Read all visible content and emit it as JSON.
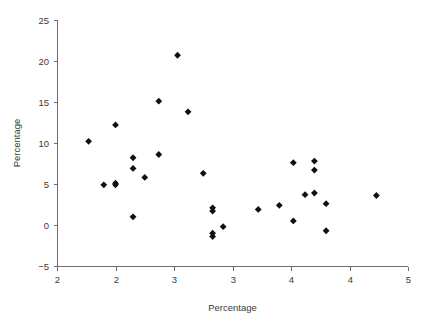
{
  "chart_data": {
    "type": "scatter",
    "title": "",
    "xlabel": "Percentage",
    "ylabel": "Percentage",
    "xlim": [
      2.0,
      5.0
    ],
    "ylim": [
      -5,
      25
    ],
    "grid": false,
    "legend": null,
    "marker": "diamond",
    "marker_color": "#101010",
    "axis_color": "#6e6e6e",
    "text_color": "#3a3a3a",
    "xticks": [
      2.0,
      2.5,
      3.0,
      3.5,
      4.0,
      4.5,
      5.0
    ],
    "xtick_labels": [
      "2",
      "2",
      "3",
      "3",
      "4",
      "4",
      "5"
    ],
    "yticks": [
      -5,
      0,
      5,
      10,
      15,
      20,
      25
    ],
    "ytick_labels": [
      "−5",
      "0",
      "5",
      "10",
      "15",
      "20",
      "25"
    ],
    "points": [
      {
        "x": 2.27,
        "y": 10.2
      },
      {
        "x": 2.4,
        "y": 4.9
      },
      {
        "x": 2.5,
        "y": 12.2
      },
      {
        "x": 2.5,
        "y": 5.1
      },
      {
        "x": 2.5,
        "y": 4.9
      },
      {
        "x": 2.65,
        "y": 8.2
      },
      {
        "x": 2.65,
        "y": 6.9
      },
      {
        "x": 2.65,
        "y": 1.0
      },
      {
        "x": 2.75,
        "y": 5.8
      },
      {
        "x": 2.87,
        "y": 15.1
      },
      {
        "x": 2.87,
        "y": 8.6
      },
      {
        "x": 3.03,
        "y": 20.7
      },
      {
        "x": 3.12,
        "y": 13.8
      },
      {
        "x": 3.25,
        "y": 6.3
      },
      {
        "x": 3.33,
        "y": 2.1
      },
      {
        "x": 3.33,
        "y": 1.7
      },
      {
        "x": 3.33,
        "y": -1.0
      },
      {
        "x": 3.33,
        "y": -1.4
      },
      {
        "x": 3.42,
        "y": -0.2
      },
      {
        "x": 3.72,
        "y": 1.9
      },
      {
        "x": 3.9,
        "y": 2.4
      },
      {
        "x": 4.02,
        "y": 7.6
      },
      {
        "x": 4.02,
        "y": 0.5
      },
      {
        "x": 4.12,
        "y": 3.7
      },
      {
        "x": 4.2,
        "y": 7.8
      },
      {
        "x": 4.2,
        "y": 6.7
      },
      {
        "x": 4.2,
        "y": 3.9
      },
      {
        "x": 4.3,
        "y": 2.6
      },
      {
        "x": 4.3,
        "y": -0.7
      },
      {
        "x": 4.73,
        "y": 3.6
      }
    ]
  },
  "layout": {
    "plot_left": 57,
    "plot_right": 408,
    "plot_top": 20,
    "plot_bottom": 266,
    "tick_len": 4,
    "marker_size": 3.4
  }
}
